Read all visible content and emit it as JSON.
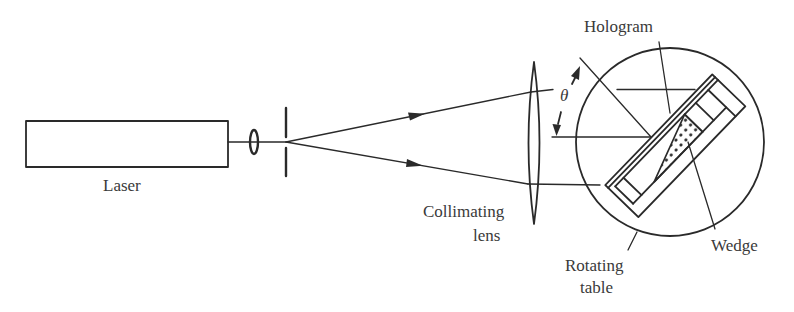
{
  "figure": {
    "labels": {
      "laser": "Laser",
      "collimating_lens_line1": "Collimating",
      "collimating_lens_line2": "lens",
      "hologram": "Hologram",
      "wedge": "Wedge",
      "rotating_table_line1": "Rotating",
      "rotating_table_line2": "table",
      "angle": "θ"
    },
    "components": [
      "laser",
      "focusing-lens",
      "pinhole",
      "diverging-beam",
      "collimating-lens",
      "rotating-table",
      "hologram",
      "wedge"
    ],
    "colors": {
      "ink": "#2a2a2a",
      "text": "#3a3a3a",
      "background": "#ffffff"
    }
  }
}
